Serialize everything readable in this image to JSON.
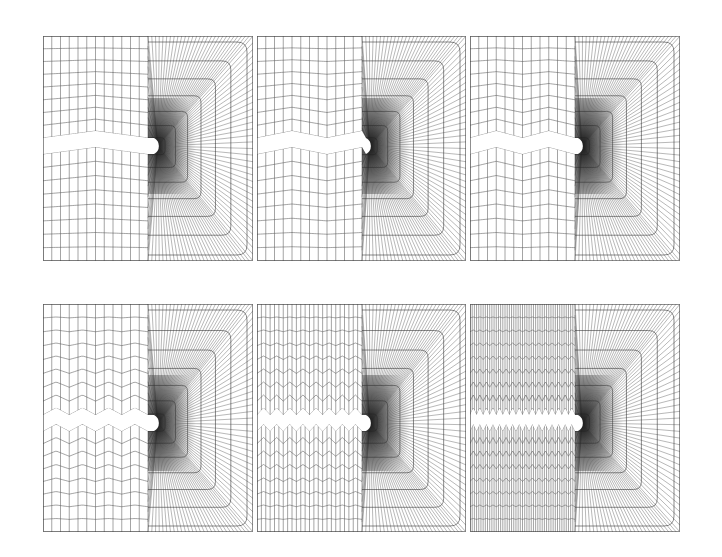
{
  "figure": {
    "background": "#ffffff",
    "line_color": "#3a3a3a",
    "rows": 2,
    "cols": 3
  },
  "panels": [
    {
      "id": "mesh-1",
      "x": 43,
      "y": 36,
      "w": 210,
      "h": 225,
      "zigzag_periods": 1,
      "notch_tip_x": 158,
      "notch_y": 146,
      "fan_start_x": 148,
      "grid_cols": 12,
      "grid_rows_half": 8
    },
    {
      "id": "mesh-2",
      "x": 257,
      "y": 36,
      "w": 209,
      "h": 225,
      "zigzag_periods": 1.5,
      "notch_tip_x": 370,
      "notch_y": 146,
      "fan_start_x": 362,
      "grid_cols": 12,
      "grid_rows_half": 8
    },
    {
      "id": "mesh-3",
      "x": 470,
      "y": 36,
      "w": 210,
      "h": 225,
      "zigzag_periods": 2,
      "notch_tip_x": 582,
      "notch_y": 146,
      "fan_start_x": 575,
      "grid_cols": 12,
      "grid_rows_half": 8
    },
    {
      "id": "mesh-4",
      "x": 43,
      "y": 304,
      "w": 210,
      "h": 228,
      "zigzag_periods": 4,
      "notch_tip_x": 158,
      "notch_y": 423,
      "fan_start_x": 148,
      "grid_cols": 12,
      "grid_rows_half": 8
    },
    {
      "id": "mesh-5",
      "x": 257,
      "y": 304,
      "w": 209,
      "h": 228,
      "zigzag_periods": 8,
      "notch_tip_x": 370,
      "notch_y": 423,
      "fan_start_x": 362,
      "grid_cols": 24,
      "grid_rows_half": 8
    },
    {
      "id": "mesh-6",
      "x": 470,
      "y": 304,
      "w": 210,
      "h": 228,
      "zigzag_periods": 16,
      "notch_tip_x": 582,
      "notch_y": 423,
      "fan_start_x": 575,
      "grid_cols": 48,
      "grid_rows_half": 8
    }
  ]
}
